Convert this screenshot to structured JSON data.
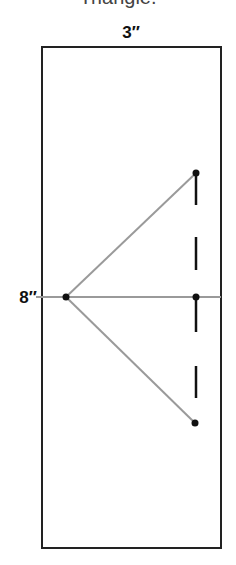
{
  "diagram": {
    "caption_partial": "Triangle.",
    "width_label": "3″",
    "height_label": "8″",
    "colors": {
      "outline": "#222222",
      "guide_line": "#9a9a9a",
      "point": "#111111",
      "dash": "#111111"
    },
    "rectangle": {
      "x": 42,
      "y": 47,
      "width": 179,
      "height": 501
    },
    "points": [
      {
        "name": "apex-left",
        "x": 66,
        "y": 297
      },
      {
        "name": "top-right",
        "x": 196,
        "y": 173
      },
      {
        "name": "mid-right",
        "x": 196,
        "y": 297
      },
      {
        "name": "bottom-right",
        "x": 196,
        "y": 423
      }
    ],
    "dashes": [
      {
        "y1": 173,
        "y2": 205
      },
      {
        "y1": 237,
        "y2": 270
      },
      {
        "y1": 297,
        "y2": 332
      },
      {
        "y1": 366,
        "y2": 398
      }
    ]
  }
}
